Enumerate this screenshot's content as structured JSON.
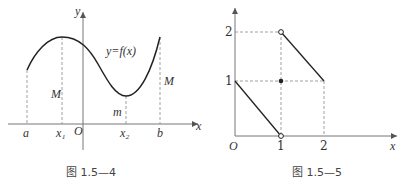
{
  "figures": [
    {
      "caption": "图 1.5—4",
      "axis_x_label": "x",
      "axis_y_label": "y",
      "origin_label": "O",
      "curve_label": "y=f(x)",
      "tick_labels": [
        "a",
        "x₁",
        "x₂",
        "b"
      ],
      "max_label_left": "M",
      "max_label_right": "M",
      "min_label": "m"
    },
    {
      "caption": "图 1.5—5",
      "axis_x_label": "x",
      "origin_label": "O",
      "x_ticks": [
        "1",
        "2"
      ],
      "y_ticks": [
        "1",
        "2"
      ],
      "segments": [
        {
          "from": [
            0,
            1
          ],
          "to": [
            1,
            0
          ],
          "start": "closed",
          "end": "open"
        },
        {
          "from": [
            1,
            2
          ],
          "to": [
            2,
            1
          ],
          "start": "open",
          "end": "closed"
        }
      ],
      "isolated_point": [
        1,
        1
      ]
    }
  ]
}
